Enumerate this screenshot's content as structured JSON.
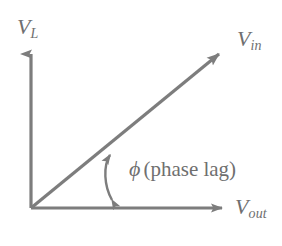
{
  "figure": {
    "type": "phasor-diagram",
    "background_color": "#ffffff",
    "stroke_color": "#7d7d7d",
    "text_color": "#6f6f6f"
  },
  "axes": {
    "vertical": {
      "symbol": "V",
      "subscript": "L",
      "full_label": "V_L",
      "arrow": "up"
    },
    "horizontal": {
      "symbol": "V",
      "subscript": "out",
      "full_label": "V_out",
      "arrow": "right"
    }
  },
  "vectors": [
    {
      "symbol": "V",
      "subscript": "in",
      "full_label": "V_in",
      "arrow": "up-right",
      "angle_degrees": 39
    }
  ],
  "angle_marker": {
    "symbol": "ϕ",
    "description": "(phase lag)",
    "arrow_style": "double-headed-arc"
  }
}
